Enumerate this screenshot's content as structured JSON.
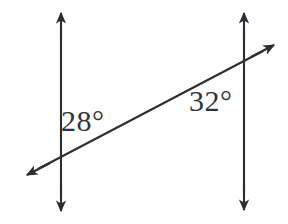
{
  "figure": {
    "background_color": "#ffffff",
    "stroke_color": "#2d2d33",
    "text_color": "#33333a",
    "width": 288,
    "height": 224,
    "lines": {
      "left_parallel": {
        "name": "left-vertical-line",
        "x": 61,
        "y_top": 12,
        "y_bottom": 211,
        "arrowheads": "both"
      },
      "right_parallel": {
        "name": "right-vertical-line",
        "x": 244,
        "y_top": 12,
        "y_bottom": 210,
        "arrowheads": "both"
      },
      "transversal": {
        "name": "transversal-line",
        "x1": 27,
        "y1": 175,
        "x2": 274,
        "y2": 45,
        "arrowheads": "both"
      }
    },
    "intersections": [
      {
        "name": "left-intersection",
        "x": 61,
        "y": 160
      },
      {
        "name": "right-intersection",
        "x": 244,
        "y": 68
      }
    ],
    "labels": [
      {
        "id": "label-28",
        "name": "angle-label-28",
        "text": "28°",
        "value": 28,
        "unit": "degrees",
        "x": 61,
        "y": 106,
        "position_note": "right of left vertical line, above transversal"
      },
      {
        "id": "label-32",
        "name": "angle-label-32",
        "text": "32°",
        "value": 32,
        "unit": "degrees",
        "x": 189,
        "y": 86,
        "position_note": "left of right vertical line, below transversal"
      }
    ]
  }
}
